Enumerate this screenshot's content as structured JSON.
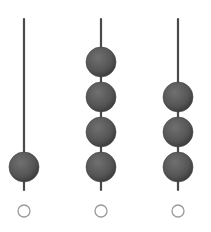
{
  "abacus": {
    "rods": [
      {
        "x": 24,
        "beads": 1,
        "label": ""
      },
      {
        "x": 101,
        "beads": 4,
        "label": ""
      },
      {
        "x": 178,
        "beads": 3,
        "label": ""
      }
    ],
    "rod_top": 19,
    "rod_bottom": 190,
    "bead_radius": 15,
    "bead_pitch": 35,
    "lowest_bead_center": 167,
    "answer_circle_y": 211,
    "answer_circle_radius": 6,
    "colors": {
      "rod": "#4a4a4a",
      "bead": "#555555",
      "bead_highlight": "#6e6e6e",
      "circle": "#9a9a9a"
    }
  }
}
